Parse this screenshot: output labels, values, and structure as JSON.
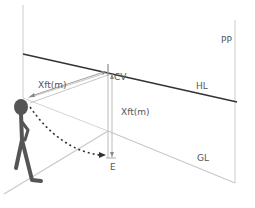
{
  "diagram": {
    "type": "perspective-drawing-setup",
    "labels": {
      "pp": "PP",
      "hl": "HL",
      "gl": "GL",
      "cv": "CV",
      "e": "E",
      "distance_horizontal": "Xft(m)",
      "distance_vertical": "Xft(m)"
    },
    "colors": {
      "hl_line": "#333333",
      "plane_lines": "#c8c8c8",
      "figure": "#555555",
      "text": "#555555",
      "dotted_arc": "#333333"
    }
  }
}
